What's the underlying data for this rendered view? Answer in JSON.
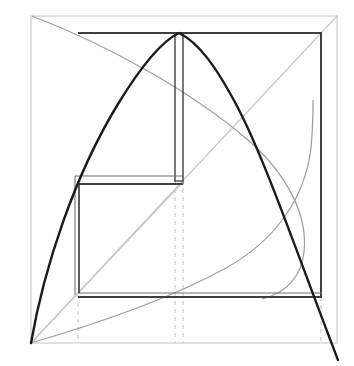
{
  "figure": {
    "canvas": {
      "width": 354,
      "height": 366,
      "background": "#ffffff"
    },
    "colors": {
      "outer_frame": "#c9c9c9",
      "parabola": "#1a1a1a",
      "rectangle_heavy": "#3a3a3a",
      "rectangle_light": "#6e6e6e",
      "light_curve": "#9a9a9a",
      "light_diagonal": "#bfbfbf",
      "dashed_guide": "#c4c4c4"
    }
  },
  "chart_data": {
    "type": "line",
    "xlabel": "",
    "ylabel": "",
    "grid": false,
    "legend": false,
    "xlim": [
      31,
      337
    ],
    "ylim": [
      343,
      16
    ],
    "annotations": [
      "outer bounding frame",
      "tall inner rectangle (top)",
      "wide inner rectangle (bottom-left)",
      "large main rectangle",
      "dashed vertical projections at x = 78, 175, 183, 321"
    ],
    "series": [
      {
        "name": "parabola",
        "style": "solid-dark",
        "points": [
          [
            31,
            343
          ],
          [
            40,
            300
          ],
          [
            50,
            259
          ],
          [
            60,
            222
          ],
          [
            70,
            190
          ],
          [
            80,
            162
          ],
          [
            92,
            133
          ],
          [
            105,
            109
          ],
          [
            118,
            89
          ],
          [
            132,
            71
          ],
          [
            146,
            56
          ],
          [
            160,
            44
          ],
          [
            175,
            35
          ],
          [
            183,
            33
          ],
          [
            196,
            36
          ],
          [
            210,
            46
          ],
          [
            224,
            62
          ],
          [
            238,
            84
          ],
          [
            252,
            111
          ],
          [
            266,
            143
          ],
          [
            280,
            180
          ],
          [
            294,
            222
          ],
          [
            308,
            268
          ],
          [
            322,
            302
          ],
          [
            338,
            358
          ]
        ]
      },
      {
        "name": "light-descending-curve",
        "style": "solid-light",
        "points": [
          [
            32,
            16
          ],
          [
            60,
            27
          ],
          [
            90,
            40
          ],
          [
            120,
            54
          ],
          [
            150,
            69
          ],
          [
            180,
            86
          ],
          [
            210,
            106
          ],
          [
            240,
            130
          ],
          [
            262,
            152
          ],
          [
            280,
            175
          ],
          [
            294,
            200
          ],
          [
            303,
            226
          ],
          [
            305,
            250
          ],
          [
            300,
            268
          ],
          [
            290,
            282
          ],
          [
            276,
            292
          ],
          [
            262,
            298
          ]
        ]
      },
      {
        "name": "light-rising-curve",
        "style": "solid-light",
        "points": [
          [
            31,
            343
          ],
          [
            60,
            333
          ],
          [
            90,
            322
          ],
          [
            120,
            311
          ],
          [
            150,
            300
          ],
          [
            175,
            291
          ],
          [
            200,
            281
          ],
          [
            225,
            268
          ],
          [
            248,
            253
          ],
          [
            268,
            236
          ],
          [
            285,
            216
          ],
          [
            297,
            194
          ],
          [
            305,
            170
          ],
          [
            310,
            142
          ],
          [
            312,
            118
          ],
          [
            313,
            100
          ]
        ]
      },
      {
        "name": "diagonal-bottomleft-to-topright",
        "style": "solid-faint",
        "points": [
          [
            31,
            343
          ],
          [
            337,
            16
          ]
        ]
      },
      {
        "name": "diagonal-bottomleft-to-rect-corner",
        "style": "solid-faint",
        "points": [
          [
            31,
            343
          ],
          [
            183,
            182
          ]
        ]
      }
    ],
    "rectangles": [
      {
        "name": "outer-frame",
        "x0": 31,
        "y0": 16,
        "x1": 337,
        "y1": 343,
        "style": "light"
      },
      {
        "name": "main-rectangle",
        "x0": 78,
        "y0": 33,
        "x1": 322,
        "y1": 297,
        "style": "heavy"
      },
      {
        "name": "tall-rectangle",
        "x0": 175,
        "y0": 33,
        "x1": 183,
        "y1": 182,
        "style": "heavy"
      },
      {
        "name": "wide-rectangle",
        "x0": 78,
        "y0": 177,
        "x1": 183,
        "y1": 297,
        "style": "heavy"
      }
    ],
    "dashed_verticals": [
      {
        "x": 78,
        "y0": 297,
        "y1": 343
      },
      {
        "x": 175,
        "y0": 182,
        "y1": 343
      },
      {
        "x": 183,
        "y0": 182,
        "y1": 343
      },
      {
        "x": 321,
        "y0": 297,
        "y1": 343
      }
    ]
  }
}
